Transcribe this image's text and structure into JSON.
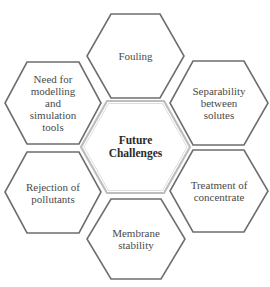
{
  "diagram": {
    "center": {
      "id": "future-challenges",
      "label": "Future\nChallenges"
    },
    "nodes": [
      {
        "id": "fouling",
        "label": "Fouling"
      },
      {
        "id": "separability",
        "label": "Separability\nbetween\nsolutes"
      },
      {
        "id": "treatment",
        "label": "Treatment of\nconcentrate"
      },
      {
        "id": "membrane-stability",
        "label": "Membrane\nstability"
      },
      {
        "id": "rejection",
        "label": "Rejection of\npollutants"
      },
      {
        "id": "modelling",
        "label": "Need for\nmodelling\nand\nsimulation\ntools"
      }
    ],
    "colors": {
      "outline": "#6e6e6e",
      "center_outline": "#bdbdbd",
      "text": "#4a4a4a"
    }
  }
}
